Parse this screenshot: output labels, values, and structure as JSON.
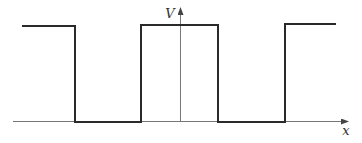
{
  "diagram": {
    "y_axis": {
      "label": "V"
    },
    "x_axis": {
      "label": "x"
    },
    "waveform": {
      "type": "square",
      "levels": [
        "high",
        "low",
        "high",
        "low",
        "high"
      ]
    },
    "colors": {
      "waveform": "#2a2a2a",
      "axes": "#666666",
      "background": "#ffffff"
    }
  }
}
